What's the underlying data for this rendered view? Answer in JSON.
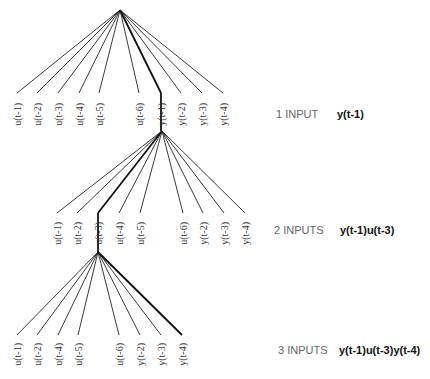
{
  "levels": [
    {
      "apex": [
        120,
        10
      ],
      "leaf_y": 93,
      "label_top": 103,
      "selected": "y(t-1)",
      "drop_to": [
        161,
        131
      ],
      "leaves": [
        {
          "label": "u(t-1)",
          "x": 17
        },
        {
          "label": "u(t-2)",
          "x": 37
        },
        {
          "label": "u(t-3)",
          "x": 58
        },
        {
          "label": "u(t-4)",
          "x": 79
        },
        {
          "label": "u(t-5)",
          "x": 99
        },
        {
          "label": "u(t-6)",
          "x": 139
        },
        {
          "label": "y(t-1)",
          "x": 161
        },
        {
          "label": "y(t-2)",
          "x": 181
        },
        {
          "label": "y(t-3)",
          "x": 202
        },
        {
          "label": "y(t-4)",
          "x": 223
        }
      ],
      "caption": "1 INPUT",
      "model": "y(t-1)",
      "caption_pos": [
        276,
        120
      ],
      "model_pos": [
        337,
        120
      ]
    },
    {
      "apex": [
        162,
        131
      ],
      "leaf_y": 213,
      "label_top": 222,
      "selected": "u(t-3)",
      "drop_to": [
        98,
        252
      ],
      "leaves": [
        {
          "label": "u(t-1)",
          "x": 57
        },
        {
          "label": "u(t-2)",
          "x": 77
        },
        {
          "label": "u(t-3)",
          "x": 98
        },
        {
          "label": "u(t-4)",
          "x": 119
        },
        {
          "label": "u(t-5)",
          "x": 140
        },
        {
          "label": "u(t-6)",
          "x": 183
        },
        {
          "label": "y(t-2)",
          "x": 203
        },
        {
          "label": "y(t-3)",
          "x": 224
        },
        {
          "label": "y(t-4)",
          "x": 245
        }
      ],
      "caption": "2 INPUTS",
      "model": "y(t-1)u(t-3)",
      "caption_pos": [
        274,
        236
      ],
      "model_pos": [
        340,
        236
      ]
    },
    {
      "apex": [
        98,
        252
      ],
      "leaf_y": 335,
      "label_top": 343,
      "selected": "y(t-4)",
      "drop_to": null,
      "leaves": [
        {
          "label": "u(t-1)",
          "x": 17
        },
        {
          "label": "u(t-2)",
          "x": 37
        },
        {
          "label": "u(t-4)",
          "x": 58
        },
        {
          "label": "u(t-5)",
          "x": 78
        },
        {
          "label": "u(t-6)",
          "x": 119
        },
        {
          "label": "y(t-2)",
          "x": 140
        },
        {
          "label": "y(t-3)",
          "x": 161
        },
        {
          "label": "y(t-4)",
          "x": 182
        }
      ],
      "caption": "3 INPUTS",
      "model": "y(t-1)u(t-3)y(t-4)",
      "caption_pos": [
        278,
        356
      ],
      "model_pos": [
        339,
        356
      ]
    }
  ]
}
